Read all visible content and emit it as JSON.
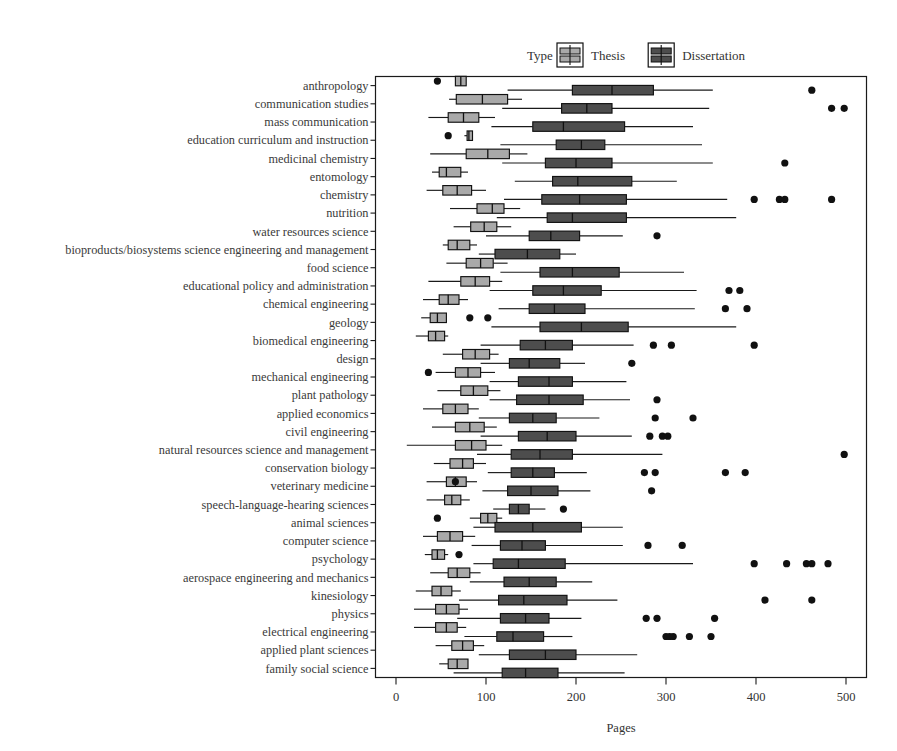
{
  "legend": {
    "title": "Type",
    "entries": [
      {
        "label": "Thesis",
        "color": "#a9a9a9"
      },
      {
        "label": "Dissertation",
        "color": "#4d4d4d"
      }
    ]
  },
  "axes": {
    "xlabel": "Pages",
    "xticks": [
      "0",
      "100",
      "200",
      "300",
      "400",
      "500"
    ],
    "xlim": [
      -20,
      520
    ]
  },
  "chart_data": {
    "type": "boxplot",
    "title": "",
    "xlabel": "Pages",
    "ylabel": "",
    "xlim": [
      -20,
      520
    ],
    "grid": false,
    "legend_position": "top-right",
    "orientation": "horizontal",
    "categories": [
      "anthropology",
      "communication studies",
      "mass communication",
      "education curriculum and instruction",
      "medicinal chemistry",
      "entomology",
      "chemistry",
      "nutrition",
      "water resources science",
      "bioproducts/biosystems science engineering and management",
      "food science",
      "educational policy and administration",
      "chemical engineering",
      "geology",
      "biomedical engineering",
      "design",
      "mechanical engineering",
      "plant pathology",
      "applied economics",
      "civil engineering",
      "natural resources science and management",
      "conservation biology",
      "veterinary medicine",
      "speech-language-hearing sciences",
      "animal sciences",
      "computer science",
      "psychology",
      "aerospace engineering and mechanics",
      "kinesiology",
      "physics",
      "electrical engineering",
      "applied plant sciences",
      "family social science"
    ],
    "series": [
      {
        "name": "Thesis",
        "color": "#a9a9a9",
        "boxes": [
          {
            "category": "anthropology",
            "whisker_low": 66,
            "q1": 66,
            "median": 72,
            "q3": 78,
            "whisker_high": 78,
            "outliers": [
              46
            ]
          },
          {
            "category": "communication studies",
            "whisker_low": 59,
            "q1": 67,
            "median": 96,
            "q3": 124,
            "whisker_high": 140,
            "outliers": []
          },
          {
            "category": "mass communication",
            "whisker_low": 36,
            "q1": 58,
            "median": 75,
            "q3": 92,
            "whisker_high": 110,
            "outliers": []
          },
          {
            "category": "education curriculum and instruction",
            "whisker_low": 76,
            "q1": 79,
            "median": 81,
            "q3": 85,
            "whisker_high": 85,
            "outliers": [
              58
            ]
          },
          {
            "category": "medicinal chemistry",
            "whisker_low": 38,
            "q1": 78,
            "median": 102,
            "q3": 126,
            "whisker_high": 146,
            "outliers": []
          },
          {
            "category": "entomology",
            "whisker_low": 40,
            "q1": 48,
            "median": 56,
            "q3": 72,
            "whisker_high": 80,
            "outliers": []
          },
          {
            "category": "chemistry",
            "whisker_low": 34,
            "q1": 52,
            "median": 68,
            "q3": 84,
            "whisker_high": 100,
            "outliers": []
          },
          {
            "category": "nutrition",
            "whisker_low": 60,
            "q1": 90,
            "median": 107,
            "q3": 120,
            "whisker_high": 138,
            "outliers": []
          },
          {
            "category": "water resources science",
            "whisker_low": 64,
            "q1": 83,
            "median": 98,
            "q3": 112,
            "whisker_high": 128,
            "outliers": []
          },
          {
            "category": "bioproducts/biosystems science engineering and management",
            "whisker_low": 52,
            "q1": 58,
            "median": 68,
            "q3": 82,
            "whisker_high": 90,
            "outliers": []
          },
          {
            "category": "food science",
            "whisker_low": 56,
            "q1": 78,
            "median": 94,
            "q3": 108,
            "whisker_high": 124,
            "outliers": []
          },
          {
            "category": "educational policy and administration",
            "whisker_low": 36,
            "q1": 72,
            "median": 88,
            "q3": 104,
            "whisker_high": 118,
            "outliers": []
          },
          {
            "category": "chemical engineering",
            "whisker_low": 30,
            "q1": 48,
            "median": 58,
            "q3": 70,
            "whisker_high": 80,
            "outliers": []
          },
          {
            "category": "geology",
            "whisker_low": 28,
            "q1": 38,
            "median": 46,
            "q3": 56,
            "whisker_high": 56,
            "outliers": [
              82,
              102
            ]
          },
          {
            "category": "biomedical engineering",
            "whisker_low": 22,
            "q1": 36,
            "median": 44,
            "q3": 54,
            "whisker_high": 58,
            "outliers": []
          },
          {
            "category": "design",
            "whisker_low": 52,
            "q1": 74,
            "median": 88,
            "q3": 104,
            "whisker_high": 114,
            "outliers": []
          },
          {
            "category": "mechanical engineering",
            "whisker_low": 44,
            "q1": 66,
            "median": 80,
            "q3": 94,
            "whisker_high": 110,
            "outliers": [
              36
            ]
          },
          {
            "category": "plant pathology",
            "whisker_low": 46,
            "q1": 72,
            "median": 86,
            "q3": 102,
            "whisker_high": 116,
            "outliers": []
          },
          {
            "category": "applied economics",
            "whisker_low": 30,
            "q1": 52,
            "median": 66,
            "q3": 80,
            "whisker_high": 92,
            "outliers": []
          },
          {
            "category": "civil engineering",
            "whisker_low": 40,
            "q1": 66,
            "median": 82,
            "q3": 98,
            "whisker_high": 112,
            "outliers": []
          },
          {
            "category": "natural resources science and management",
            "whisker_low": 12,
            "q1": 66,
            "median": 84,
            "q3": 100,
            "whisker_high": 118,
            "outliers": []
          },
          {
            "category": "conservation biology",
            "whisker_low": 42,
            "q1": 60,
            "median": 74,
            "q3": 86,
            "whisker_high": 100,
            "outliers": []
          },
          {
            "category": "veterinary medicine",
            "whisker_low": 34,
            "q1": 56,
            "median": 66,
            "q3": 78,
            "whisker_high": 90,
            "outliers": [
              66
            ]
          },
          {
            "category": "speech-language-hearing sciences",
            "whisker_low": 34,
            "q1": 54,
            "median": 62,
            "q3": 72,
            "whisker_high": 82,
            "outliers": []
          },
          {
            "category": "animal sciences",
            "whisker_low": 82,
            "q1": 94,
            "median": 102,
            "q3": 112,
            "whisker_high": 118,
            "outliers": [
              46
            ]
          },
          {
            "category": "computer science",
            "whisker_low": 30,
            "q1": 46,
            "median": 60,
            "q3": 74,
            "whisker_high": 88,
            "outliers": []
          },
          {
            "category": "psychology",
            "whisker_low": 32,
            "q1": 40,
            "median": 46,
            "q3": 54,
            "whisker_high": 58,
            "outliers": [
              70
            ]
          },
          {
            "category": "aerospace engineering and mechanics",
            "whisker_low": 38,
            "q1": 58,
            "median": 68,
            "q3": 82,
            "whisker_high": 94,
            "outliers": []
          },
          {
            "category": "kinesiology",
            "whisker_low": 22,
            "q1": 40,
            "median": 50,
            "q3": 62,
            "whisker_high": 72,
            "outliers": []
          },
          {
            "category": "physics",
            "whisker_low": 20,
            "q1": 44,
            "median": 56,
            "q3": 70,
            "whisker_high": 80,
            "outliers": []
          },
          {
            "category": "electrical engineering",
            "whisker_low": 20,
            "q1": 44,
            "median": 56,
            "q3": 68,
            "whisker_high": 78,
            "outliers": []
          },
          {
            "category": "applied plant sciences",
            "whisker_low": 44,
            "q1": 62,
            "median": 74,
            "q3": 86,
            "whisker_high": 98,
            "outliers": []
          },
          {
            "category": "family social science",
            "whisker_low": 48,
            "q1": 58,
            "median": 68,
            "q3": 80,
            "whisker_high": 80,
            "outliers": []
          }
        ]
      },
      {
        "name": "Dissertation",
        "color": "#4d4d4d",
        "boxes": [
          {
            "category": "anthropology",
            "whisker_low": 124,
            "q1": 196,
            "median": 240,
            "q3": 286,
            "whisker_high": 352,
            "outliers": [
              462
            ]
          },
          {
            "category": "communication studies",
            "whisker_low": 118,
            "q1": 184,
            "median": 212,
            "q3": 240,
            "whisker_high": 348,
            "outliers": [
              484,
              498
            ]
          },
          {
            "category": "mass communication",
            "whisker_low": 106,
            "q1": 152,
            "median": 186,
            "q3": 254,
            "whisker_high": 330,
            "outliers": []
          },
          {
            "category": "education curriculum and instruction",
            "whisker_low": 116,
            "q1": 178,
            "median": 206,
            "q3": 232,
            "whisker_high": 340,
            "outliers": []
          },
          {
            "category": "medicinal chemistry",
            "whisker_low": 118,
            "q1": 166,
            "median": 200,
            "q3": 240,
            "whisker_high": 352,
            "outliers": [
              432
            ]
          },
          {
            "category": "entomology",
            "whisker_low": 132,
            "q1": 174,
            "median": 202,
            "q3": 262,
            "whisker_high": 312,
            "outliers": []
          },
          {
            "category": "chemistry",
            "whisker_low": 120,
            "q1": 162,
            "median": 204,
            "q3": 256,
            "whisker_high": 368,
            "outliers": [
              398,
              426,
              432,
              484
            ]
          },
          {
            "category": "nutrition",
            "whisker_low": 112,
            "q1": 168,
            "median": 196,
            "q3": 256,
            "whisker_high": 378,
            "outliers": []
          },
          {
            "category": "water resources science",
            "whisker_low": 100,
            "q1": 148,
            "median": 172,
            "q3": 204,
            "whisker_high": 252,
            "outliers": [
              290
            ]
          },
          {
            "category": "bioproducts/biosystems science engineering and management",
            "whisker_low": 92,
            "q1": 110,
            "median": 146,
            "q3": 182,
            "whisker_high": 200,
            "outliers": []
          },
          {
            "category": "food science",
            "whisker_low": 116,
            "q1": 160,
            "median": 196,
            "q3": 248,
            "whisker_high": 320,
            "outliers": []
          },
          {
            "category": "educational policy and administration",
            "whisker_low": 104,
            "q1": 152,
            "median": 186,
            "q3": 228,
            "whisker_high": 334,
            "outliers": [
              370,
              382
            ]
          },
          {
            "category": "chemical engineering",
            "whisker_low": 114,
            "q1": 148,
            "median": 176,
            "q3": 210,
            "whisker_high": 332,
            "outliers": [
              366,
              390
            ]
          },
          {
            "category": "geology",
            "whisker_low": 106,
            "q1": 160,
            "median": 206,
            "q3": 258,
            "whisker_high": 378,
            "outliers": []
          },
          {
            "category": "biomedical engineering",
            "whisker_low": 94,
            "q1": 138,
            "median": 166,
            "q3": 196,
            "whisker_high": 264,
            "outliers": [
              286,
              306,
              398
            ]
          },
          {
            "category": "design",
            "whisker_low": 94,
            "q1": 126,
            "median": 148,
            "q3": 182,
            "whisker_high": 210,
            "outliers": [
              262
            ]
          },
          {
            "category": "mechanical engineering",
            "whisker_low": 104,
            "q1": 136,
            "median": 170,
            "q3": 196,
            "whisker_high": 256,
            "outliers": []
          },
          {
            "category": "plant pathology",
            "whisker_low": 104,
            "q1": 134,
            "median": 170,
            "q3": 208,
            "whisker_high": 260,
            "outliers": [
              290
            ]
          },
          {
            "category": "applied economics",
            "whisker_low": 92,
            "q1": 126,
            "median": 152,
            "q3": 178,
            "whisker_high": 226,
            "outliers": [
              288,
              330
            ]
          },
          {
            "category": "civil engineering",
            "whisker_low": 94,
            "q1": 136,
            "median": 168,
            "q3": 200,
            "whisker_high": 262,
            "outliers": [
              282,
              296,
              302
            ]
          },
          {
            "category": "natural resources science and management",
            "whisker_low": 90,
            "q1": 128,
            "median": 160,
            "q3": 196,
            "whisker_high": 296,
            "outliers": [
              498
            ]
          },
          {
            "category": "conservation biology",
            "whisker_low": 102,
            "q1": 128,
            "median": 152,
            "q3": 176,
            "whisker_high": 212,
            "outliers": [
              276,
              288,
              366,
              388
            ]
          },
          {
            "category": "veterinary medicine",
            "whisker_low": 96,
            "q1": 124,
            "median": 150,
            "q3": 180,
            "whisker_high": 216,
            "outliers": [
              284
            ]
          },
          {
            "category": "speech-language-hearing sciences",
            "whisker_low": 108,
            "q1": 126,
            "median": 136,
            "q3": 148,
            "whisker_high": 166,
            "outliers": [
              186
            ]
          },
          {
            "category": "animal sciences",
            "whisker_low": 86,
            "q1": 110,
            "median": 152,
            "q3": 206,
            "whisker_high": 252,
            "outliers": []
          },
          {
            "category": "computer science",
            "whisker_low": 84,
            "q1": 116,
            "median": 140,
            "q3": 166,
            "whisker_high": 252,
            "outliers": [
              280,
              318
            ]
          },
          {
            "category": "psychology",
            "whisker_low": 86,
            "q1": 108,
            "median": 136,
            "q3": 188,
            "whisker_high": 330,
            "outliers": [
              398,
              434,
              456,
              462,
              480
            ]
          },
          {
            "category": "aerospace engineering and mechanics",
            "whisker_low": 82,
            "q1": 120,
            "median": 148,
            "q3": 178,
            "whisker_high": 218,
            "outliers": []
          },
          {
            "category": "kinesiology",
            "whisker_low": 70,
            "q1": 114,
            "median": 142,
            "q3": 190,
            "whisker_high": 246,
            "outliers": [
              410,
              462
            ]
          },
          {
            "category": "physics",
            "whisker_low": 68,
            "q1": 116,
            "median": 144,
            "q3": 170,
            "whisker_high": 206,
            "outliers": [
              278,
              290,
              354
            ]
          },
          {
            "category": "electrical engineering",
            "whisker_low": 76,
            "q1": 112,
            "median": 130,
            "q3": 164,
            "whisker_high": 196,
            "outliers": [
              300,
              304,
              308,
              326,
              350
            ]
          },
          {
            "category": "applied plant sciences",
            "whisker_low": 92,
            "q1": 126,
            "median": 166,
            "q3": 200,
            "whisker_high": 268,
            "outliers": []
          },
          {
            "category": "family social science",
            "whisker_low": 64,
            "q1": 118,
            "median": 144,
            "q3": 180,
            "whisker_high": 254,
            "outliers": []
          }
        ]
      }
    ]
  }
}
